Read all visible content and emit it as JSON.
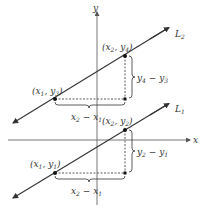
{
  "diagram": {
    "colors": {
      "line": "#333333",
      "axis": "#555555",
      "text": "#333333",
      "background": "#ffffff"
    },
    "axes": {
      "x_label": "x",
      "y_label": "y"
    },
    "lines": [
      {
        "id": "L2",
        "label": "L",
        "sub": "2",
        "points": [
          {
            "label_x": "x",
            "label_x_sub": "1",
            "label_y": "y",
            "label_y_sub": "3"
          },
          {
            "label_x": "x",
            "label_x_sub": "2",
            "label_y": "y",
            "label_y_sub": "4"
          }
        ],
        "run_label": {
          "a": "x",
          "a_sub": "2",
          "b": "x",
          "b_sub": "1",
          "op": "−"
        },
        "rise_label": {
          "a": "y",
          "a_sub": "4",
          "b": "y",
          "b_sub": "3",
          "op": "−"
        }
      },
      {
        "id": "L1",
        "label": "L",
        "sub": "1",
        "points": [
          {
            "label_x": "x",
            "label_x_sub": "1",
            "label_y": "y",
            "label_y_sub": "1"
          },
          {
            "label_x": "x",
            "label_x_sub": "2",
            "label_y": "y",
            "label_y_sub": "2"
          }
        ],
        "run_label": {
          "a": "x",
          "a_sub": "2",
          "b": "x",
          "b_sub": "1",
          "op": "−"
        },
        "rise_label": {
          "a": "y",
          "a_sub": "2",
          "b": "y",
          "b_sub": "1",
          "op": "−"
        }
      }
    ]
  }
}
